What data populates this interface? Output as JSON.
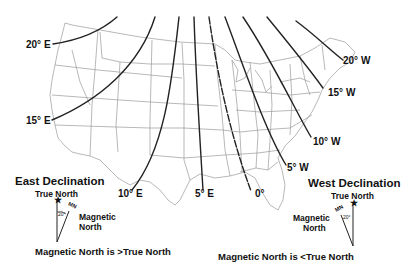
{
  "map": {
    "title": "Magnetic Declination - United States",
    "colors": {
      "isogonic_line": "#222222",
      "state_border": "#9a9a9a",
      "text": "#111111",
      "background": "#ffffff"
    },
    "isogonic_lines": [
      {
        "id": "20E",
        "label": "20° E",
        "declination": 20,
        "direction": "E"
      },
      {
        "id": "15E",
        "label": "15° E",
        "declination": 15,
        "direction": "E"
      },
      {
        "id": "10E",
        "label": "10° E",
        "declination": 10,
        "direction": "E"
      },
      {
        "id": "5E",
        "label": "5° E",
        "declination": 5,
        "direction": "E"
      },
      {
        "id": "0",
        "label": "0°",
        "declination": 0,
        "direction": "agonic"
      },
      {
        "id": "5W",
        "label": "5° W",
        "declination": 5,
        "direction": "W"
      },
      {
        "id": "10W",
        "label": "10° W",
        "declination": 10,
        "direction": "W"
      },
      {
        "id": "15W",
        "label": "15° W",
        "declination": 15,
        "direction": "W"
      },
      {
        "id": "20W",
        "label": "20° W",
        "declination": 20,
        "direction": "W"
      }
    ]
  },
  "legend": {
    "east": {
      "title": "East Declination",
      "true_north": "True North",
      "mn_abbrev": "MN",
      "angle": "20°",
      "magnetic_line1": "Magnetic",
      "magnetic_line2": "North",
      "caption": "Magnetic North is >True North"
    },
    "west": {
      "title": "West Declination",
      "true_north": "True North",
      "mn_abbrev": "MN",
      "angle": "20°",
      "magnetic_line1": "Magnetic",
      "magnetic_line2": "North",
      "caption": "Magnetic North is <True North"
    }
  }
}
